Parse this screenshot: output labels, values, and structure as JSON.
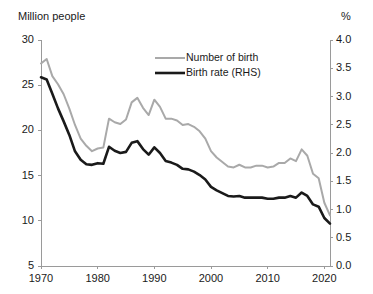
{
  "chart_data": {
    "type": "line",
    "title": "",
    "xlabel": "",
    "ylabel": "Million people",
    "y2label": "%",
    "left_unit": "Million people",
    "right_unit": "%",
    "grid": false,
    "legend_position": "top-center",
    "xlim": [
      1970,
      2021
    ],
    "ylim": [
      5,
      30
    ],
    "y2lim": [
      0.0,
      4.0
    ],
    "xticks": [
      1970,
      1980,
      1990,
      2000,
      2010,
      2020
    ],
    "xtick_labels": [
      "1970",
      "1980",
      "1990",
      "2000",
      "2010",
      "2020"
    ],
    "yticks": [
      5,
      10,
      15,
      20,
      25,
      30
    ],
    "ytick_labels": [
      "5",
      "10",
      "15",
      "20",
      "25",
      "30"
    ],
    "y2ticks": [
      0.0,
      0.5,
      1.0,
      1.5,
      2.0,
      2.5,
      3.0,
      3.5,
      4.0
    ],
    "y2tick_labels": [
      "0.0",
      "0.5",
      "1.0",
      "1.5",
      "2.0",
      "2.5",
      "3.0",
      "3.5",
      "4.0"
    ],
    "x": [
      1970,
      1971,
      1972,
      1973,
      1974,
      1975,
      1976,
      1977,
      1978,
      1979,
      1980,
      1981,
      1982,
      1983,
      1984,
      1985,
      1986,
      1987,
      1988,
      1989,
      1990,
      1991,
      1992,
      1993,
      1994,
      1995,
      1996,
      1997,
      1998,
      1999,
      2000,
      2001,
      2002,
      2003,
      2004,
      2005,
      2006,
      2007,
      2008,
      2009,
      2010,
      2011,
      2012,
      2013,
      2014,
      2015,
      2016,
      2017,
      2018,
      2019,
      2020,
      2021
    ],
    "series": [
      {
        "name": "Number of birth",
        "axis": "left",
        "color": "#a9a9a9",
        "width": 2.0,
        "unit": "million people",
        "values": [
          27.4,
          27.9,
          26.0,
          25.1,
          24.0,
          22.4,
          20.6,
          19.1,
          18.3,
          17.7,
          18.0,
          18.1,
          21.3,
          20.9,
          20.7,
          21.2,
          23.1,
          23.6,
          22.5,
          21.7,
          23.4,
          22.6,
          21.3,
          21.3,
          21.1,
          20.6,
          20.7,
          20.4,
          19.9,
          19.1,
          17.7,
          17.0,
          16.5,
          16.0,
          15.9,
          16.2,
          15.9,
          15.9,
          16.1,
          16.1,
          15.9,
          16.0,
          16.4,
          16.4,
          16.9,
          16.6,
          17.9,
          17.2,
          15.2,
          14.7,
          12.0,
          10.6
        ]
      },
      {
        "name": "Birth rate (RHS)",
        "axis": "right",
        "color": "#1a1a1a",
        "width": 2.6,
        "unit": "percent",
        "values": [
          3.34,
          3.3,
          3.05,
          2.79,
          2.56,
          2.32,
          2.03,
          1.88,
          1.8,
          1.79,
          1.82,
          1.81,
          2.11,
          2.04,
          2.0,
          2.02,
          2.18,
          2.21,
          2.07,
          1.97,
          2.1,
          2.0,
          1.86,
          1.83,
          1.79,
          1.72,
          1.71,
          1.67,
          1.61,
          1.53,
          1.4,
          1.34,
          1.29,
          1.24,
          1.23,
          1.24,
          1.21,
          1.21,
          1.21,
          1.21,
          1.19,
          1.19,
          1.21,
          1.21,
          1.24,
          1.21,
          1.3,
          1.24,
          1.09,
          1.05,
          0.85,
          0.75
        ]
      }
    ],
    "legend": [
      {
        "label": "Number of birth",
        "color": "#a9a9a9"
      },
      {
        "label": "Birth rate (RHS)",
        "color": "#1a1a1a"
      }
    ]
  },
  "axis_colors": {
    "axis_line": "#9a9a9a",
    "text": "#1a1a1a"
  }
}
